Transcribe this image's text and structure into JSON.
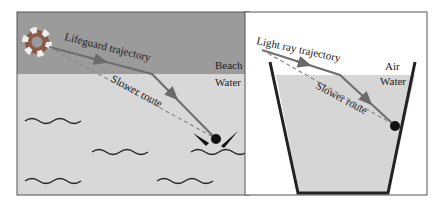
{
  "left_panel": {
    "trajectory_label": "Lifeguard trajectory",
    "slower_label": "Slower route",
    "beach_label": "Beach",
    "water_label": "Water",
    "colors": {
      "beach": "#9a9a9a",
      "water": "#d9d9d9",
      "path": "#707070"
    }
  },
  "right_panel": {
    "trajectory_label": "Light ray trajectory",
    "slower_label": "Slower route",
    "air_label": "Air",
    "water_label": "Water",
    "colors": {
      "air": "#ffffff",
      "water": "#d6d6d6",
      "path": "#707070"
    }
  }
}
